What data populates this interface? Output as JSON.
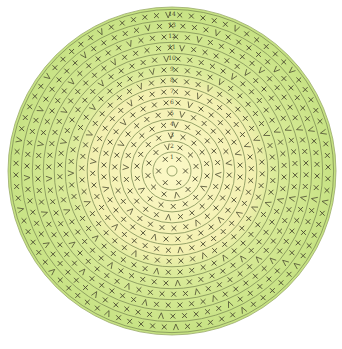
{
  "diagram": {
    "type": "crochet-round-chart",
    "center": [
      172,
      171
    ],
    "outer_radius": 164,
    "rounds": 14,
    "round_labels": [
      "1",
      "2",
      "3",
      "4",
      "5",
      "6",
      "7",
      "8",
      "9",
      "10",
      "11",
      "12",
      "13",
      "14"
    ],
    "stitch_symbol": "×",
    "stitch_name": "single crochet",
    "increase_symbol": "V (two stitches in one)",
    "colors": {
      "inner_fill": "#f8f4b8",
      "outer_fill": "#cde68a",
      "ring_stroke": "#7f8f55",
      "symbol": "#4a4a30",
      "background": "#ffffff"
    },
    "inner_color_rounds": 8,
    "stitches_per_round": [
      6,
      12,
      18,
      24,
      30,
      36,
      42,
      48,
      54,
      60,
      66,
      72,
      78,
      84
    ]
  }
}
